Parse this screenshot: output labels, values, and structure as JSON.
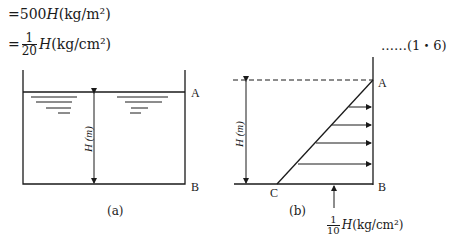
{
  "equations": [
    {
      "prefix": "=500",
      "var": "H",
      "unit": "(kg/m²)"
    },
    {
      "prefix": "=",
      "frac_num": "1",
      "frac_den": "20",
      "var": "H",
      "unit": "(kg/cm²)"
    }
  ],
  "equation_number": "……(1・6)",
  "figure_a": {
    "caption": "(a)",
    "label_top": "A",
    "label_bottom": "B",
    "height_label": "H (m)"
  },
  "figure_b": {
    "caption": "(b)",
    "label_top": "A",
    "label_bottom": "B",
    "label_corner": "C",
    "height_label": "H (m)",
    "pressure_label": {
      "frac_num": "1",
      "frac_den": "10",
      "var": "H",
      "unit": "(kg/cm²)"
    }
  },
  "colors": {
    "ink": "#1a1a1a",
    "background": "#ffffff"
  }
}
